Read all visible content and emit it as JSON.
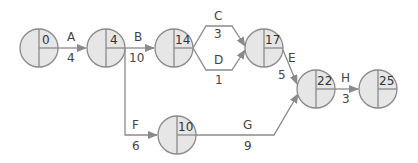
{
  "diagram": {
    "type": "activity-on-arrow network",
    "nodes": [
      {
        "id": "n0",
        "value": "0",
        "cx": 39,
        "cy": 48
      },
      {
        "id": "n4",
        "value": "4",
        "cx": 106,
        "cy": 48
      },
      {
        "id": "n14",
        "value": "14",
        "cx": 174,
        "cy": 48
      },
      {
        "id": "n17",
        "value": "17",
        "cx": 264,
        "cy": 48
      },
      {
        "id": "n22",
        "value": "22",
        "cx": 316,
        "cy": 89
      },
      {
        "id": "n25",
        "value": "25",
        "cx": 378,
        "cy": 89
      },
      {
        "id": "n10",
        "value": "10",
        "cx": 177,
        "cy": 135
      }
    ],
    "activities": [
      {
        "name": "A",
        "duration": "4",
        "from": "0",
        "to": "4"
      },
      {
        "name": "B",
        "duration": "10",
        "from": "4",
        "to": "14"
      },
      {
        "name": "C",
        "duration": "3",
        "from": "14",
        "to": "17"
      },
      {
        "name": "D",
        "duration": "1",
        "from": "14",
        "to": "17"
      },
      {
        "name": "E",
        "duration": "5",
        "from": "17",
        "to": "22"
      },
      {
        "name": "F",
        "duration": "6",
        "from": "4",
        "to": "10"
      },
      {
        "name": "G",
        "duration": "9",
        "from": "10",
        "to": "22"
      },
      {
        "name": "H",
        "duration": "3",
        "from": "22",
        "to": "25"
      }
    ]
  },
  "colors": {
    "node_fill": "#e6e6e6",
    "stroke": "#8a8a8a",
    "text": "#444444"
  }
}
